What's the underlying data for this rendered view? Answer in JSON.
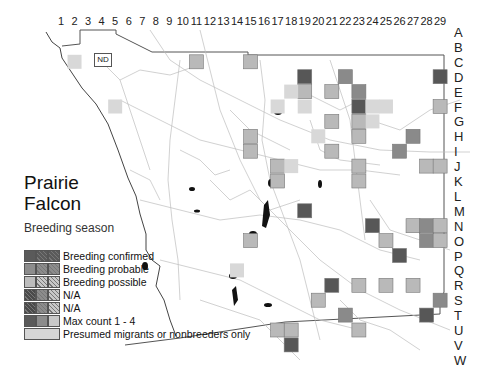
{
  "title_line1": "Prairie",
  "title_line2": "Falcon",
  "subtitle": "Breeding season",
  "no_data_label": "ND",
  "columns": [
    "1",
    "2",
    "3",
    "4",
    "5",
    "6",
    "7",
    "8",
    "9",
    "10",
    "11",
    "12",
    "13",
    "14",
    "15",
    "16",
    "17",
    "18",
    "19",
    "20",
    "21",
    "22",
    "23",
    "24",
    "25",
    "26",
    "27",
    "28",
    "29"
  ],
  "rows": [
    "A",
    "B",
    "C",
    "D",
    "E",
    "F",
    "G",
    "H",
    "I",
    "J",
    "K",
    "L",
    "M",
    "N",
    "O",
    "P",
    "Q",
    "R",
    "S",
    "T",
    "U",
    "V",
    "W"
  ],
  "legend": [
    {
      "label": "Breeding confirmed",
      "colors": [
        "#5a5a5a",
        "#5a5a5a",
        "#5a5a5a"
      ],
      "hatch": [
        false,
        true,
        true
      ]
    },
    {
      "label": "Breeding probable",
      "colors": [
        "#8c8c8c",
        "#8c8c8c",
        "#8c8c8c"
      ],
      "hatch": [
        false,
        true,
        true
      ]
    },
    {
      "label": "Breeding possible",
      "colors": [
        "#bdbdbd",
        "#c8c8c8",
        "#c8c8c8"
      ],
      "hatch": [
        false,
        true,
        true
      ]
    },
    {
      "label": "N/A",
      "colors": [
        "#4a4a4a",
        "#8c8c8c",
        "#c8c8c8"
      ],
      "hatch": [
        true,
        true,
        true
      ]
    },
    {
      "label": "N/A",
      "colors": [
        "#4a4a4a",
        "#8c8c8c",
        "#c8c8c8"
      ],
      "hatch": [
        true,
        true,
        true
      ]
    },
    {
      "label": "Max count 1 - 4",
      "colors": [
        "#5a5a5a",
        "#8c8c8c",
        "#c8c8c8"
      ],
      "hatch": [
        false,
        false,
        false
      ]
    },
    {
      "label": "Presumed migrants or nonbreeders only",
      "colors": [
        "#d6d6d6"
      ],
      "hatch": [
        false
      ]
    }
  ],
  "colors": {
    "confirmed": "#575757",
    "probable": "#8a8a8a",
    "possible": "#b9b9b9",
    "presumed": "#d8d8d8",
    "border": "#777777"
  },
  "squares": [
    {
      "col": 2,
      "row": "C",
      "status": "presumed"
    },
    {
      "col": 5,
      "row": "F",
      "status": "presumed"
    },
    {
      "col": 11,
      "row": "C",
      "status": "possible"
    },
    {
      "col": 15,
      "row": "C",
      "status": "possible"
    },
    {
      "col": 19,
      "row": "D",
      "status": "confirmed"
    },
    {
      "col": 19,
      "row": "E",
      "status": "possible"
    },
    {
      "col": 18,
      "row": "E",
      "status": "presumed"
    },
    {
      "col": 17,
      "row": "F",
      "status": "presumed"
    },
    {
      "col": 19,
      "row": "F",
      "status": "presumed"
    },
    {
      "col": 21,
      "row": "E",
      "status": "possible"
    },
    {
      "col": 22,
      "row": "D",
      "status": "probable"
    },
    {
      "col": 23,
      "row": "E",
      "status": "probable"
    },
    {
      "col": 23,
      "row": "F",
      "status": "confirmed"
    },
    {
      "col": 23,
      "row": "G",
      "status": "possible"
    },
    {
      "col": 23,
      "row": "H",
      "status": "possible"
    },
    {
      "col": 24,
      "row": "F",
      "status": "presumed"
    },
    {
      "col": 25,
      "row": "F",
      "status": "presumed"
    },
    {
      "col": 24,
      "row": "G",
      "status": "presumed"
    },
    {
      "col": 21,
      "row": "G",
      "status": "possible"
    },
    {
      "col": 21,
      "row": "I",
      "status": "possible"
    },
    {
      "col": 20,
      "row": "H",
      "status": "presumed"
    },
    {
      "col": 27,
      "row": "H",
      "status": "probable"
    },
    {
      "col": 26,
      "row": "I",
      "status": "probable"
    },
    {
      "col": 29,
      "row": "D",
      "status": "confirmed"
    },
    {
      "col": 29,
      "row": "F",
      "status": "possible"
    },
    {
      "col": 28,
      "row": "J",
      "status": "possible"
    },
    {
      "col": 29,
      "row": "J",
      "status": "possible"
    },
    {
      "col": 15,
      "row": "H",
      "status": "possible"
    },
    {
      "col": 15,
      "row": "I",
      "status": "possible"
    },
    {
      "col": 17,
      "row": "J",
      "status": "possible"
    },
    {
      "col": 17,
      "row": "K",
      "status": "possible"
    },
    {
      "col": 18,
      "row": "J",
      "status": "presumed"
    },
    {
      "col": 23,
      "row": "J",
      "status": "possible"
    },
    {
      "col": 23,
      "row": "K",
      "status": "possible"
    },
    {
      "col": 19,
      "row": "M",
      "status": "confirmed"
    },
    {
      "col": 24,
      "row": "N",
      "status": "confirmed"
    },
    {
      "col": 27,
      "row": "N",
      "status": "possible"
    },
    {
      "col": 28,
      "row": "N",
      "status": "probable"
    },
    {
      "col": 29,
      "row": "N",
      "status": "possible"
    },
    {
      "col": 28,
      "row": "O",
      "status": "probable"
    },
    {
      "col": 29,
      "row": "O",
      "status": "possible"
    },
    {
      "col": 25,
      "row": "O",
      "status": "possible"
    },
    {
      "col": 26,
      "row": "P",
      "status": "confirmed"
    },
    {
      "col": 15,
      "row": "O",
      "status": "possible"
    },
    {
      "col": 14,
      "row": "Q",
      "status": "presumed"
    },
    {
      "col": 21,
      "row": "R",
      "status": "confirmed"
    },
    {
      "col": 23,
      "row": "R",
      "status": "possible"
    },
    {
      "col": 25,
      "row": "R",
      "status": "possible"
    },
    {
      "col": 27,
      "row": "R",
      "status": "possible"
    },
    {
      "col": 29,
      "row": "S",
      "status": "probable"
    },
    {
      "col": 28,
      "row": "T",
      "status": "confirmed"
    },
    {
      "col": 20,
      "row": "S",
      "status": "possible"
    },
    {
      "col": 22,
      "row": "T",
      "status": "probable"
    },
    {
      "col": 23,
      "row": "U",
      "status": "possible"
    },
    {
      "col": 17,
      "row": "U",
      "status": "possible"
    },
    {
      "col": 18,
      "row": "U",
      "status": "possible"
    },
    {
      "col": 18,
      "row": "V",
      "status": "confirmed"
    }
  ]
}
